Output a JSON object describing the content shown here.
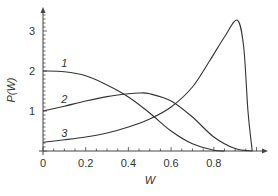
{
  "chart_data": {
    "type": "line",
    "title": "",
    "xlabel": "W",
    "ylabel": "P(W)",
    "xlim": [
      0,
      1.05
    ],
    "ylim": [
      0,
      3.4
    ],
    "grid": false,
    "legend": "inline curve labels",
    "x_ticks": [
      "0",
      "0.2",
      "0.4",
      "0.6",
      "0.8"
    ],
    "y_ticks": [
      "1",
      "2",
      "3"
    ],
    "series": [
      {
        "name": "1",
        "x": [
          0,
          0.1,
          0.2,
          0.3,
          0.4,
          0.5,
          0.6,
          0.7,
          0.8,
          0.85
        ],
        "y": [
          2.0,
          1.98,
          1.88,
          1.65,
          1.35,
          0.95,
          0.5,
          0.18,
          0.02,
          0
        ]
      },
      {
        "name": "2",
        "x": [
          0,
          0.1,
          0.2,
          0.3,
          0.4,
          0.45,
          0.5,
          0.6,
          0.7,
          0.8,
          0.9,
          0.98
        ],
        "y": [
          1.0,
          1.12,
          1.25,
          1.36,
          1.43,
          1.45,
          1.43,
          1.25,
          0.85,
          0.35,
          0.06,
          0
        ]
      },
      {
        "name": "3",
        "x": [
          0,
          0.1,
          0.2,
          0.3,
          0.4,
          0.5,
          0.6,
          0.7,
          0.78,
          0.85,
          0.91,
          0.94,
          0.96,
          0.98
        ],
        "y": [
          0.22,
          0.28,
          0.35,
          0.45,
          0.6,
          0.8,
          1.1,
          1.6,
          2.25,
          2.85,
          3.27,
          2.6,
          1.0,
          0
        ]
      }
    ],
    "curve_labels": [
      {
        "text": "1",
        "x": 0.1,
        "y": 2.2
      },
      {
        "text": "2",
        "x": 0.1,
        "y": 1.3
      },
      {
        "text": "3",
        "x": 0.1,
        "y": 0.45
      }
    ]
  }
}
